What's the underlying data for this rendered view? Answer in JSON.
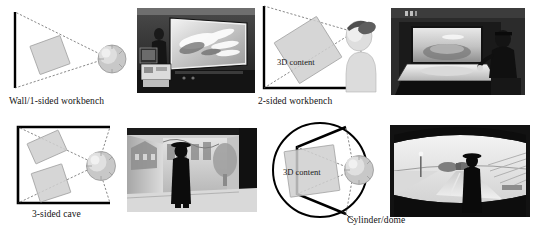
{
  "figure": {
    "layout": "2x2 grid of schematic diagram plus grayscale photograph",
    "panels": [
      {
        "id": "wall-1-sided-workbench",
        "caption": "Wall/1-sided workbench",
        "content_label": "",
        "screen_sides": 1,
        "photo_description": "Dark room with a large front-projected wall screen showing light-colored organic shapes; a CRT monitor and projector equipment on a table at lower left."
      },
      {
        "id": "2-sided-workbench",
        "caption": "2-sided workbench",
        "content_label": "3D content",
        "screen_sides": 2,
        "photo_description": "Seated user wearing stereo glasses at an L-shaped workbench with a bright vertical screen and an angled tabletop screen."
      },
      {
        "id": "3-sided-cave",
        "caption": "3-sided cave",
        "content_label": "",
        "screen_sides": 3,
        "photo_description": "Standing silhouetted user inside a three-walled CAVE with projected architectural and landscape imagery."
      },
      {
        "id": "cylinder-dome",
        "caption": "Cylinder/dome",
        "content_label": "3D content",
        "screen_sides": 5,
        "photo_description": "Standing silhouetted user in front of a curved panoramic screen showing a road and landscape driving scene."
      }
    ]
  },
  "colors": {
    "wall_stroke": "#000000",
    "ray_stroke": "#555555",
    "content_fill": "#cfcfcf",
    "head_fill": "#d5d5d5",
    "cap_fill": "#4a4a4a",
    "background": "#ffffff",
    "caption_text": "#111111"
  }
}
